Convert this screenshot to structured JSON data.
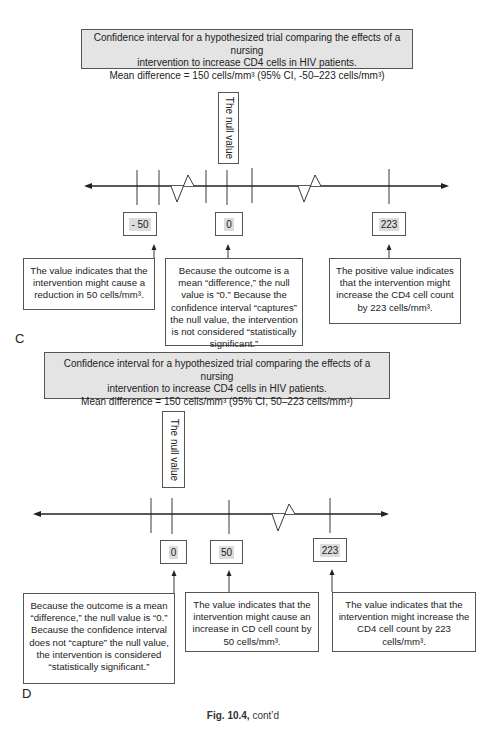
{
  "panel_c": {
    "label": "C",
    "header": {
      "line1": "Confidence interval for a hypothesized trial comparing the effects of a nursing",
      "line2": "intervention to increase CD4 cells in HIV patients.",
      "line3": "Mean difference = 150 cells/mm³ (95% CI, -50–223 cells/mm³)"
    },
    "null_label": "The null value",
    "value_boxes": [
      "- 50",
      "0",
      "223"
    ],
    "explanations": [
      "The value indicates that the intervention might cause a reduction in 50 cells/mm³.",
      "Because the outcome is a mean “difference,” the null value is “0.” Because the confidence interval “captures” the null value, the intervention is not considered “statistically significant.”",
      "The positive value indicates that the intervention might increase the CD4 cell count by 223 cells/mm³."
    ]
  },
  "panel_d": {
    "label": "D",
    "header": {
      "line1": "Confidence interval for a hypothesized trial comparing the effects of a nursing",
      "line2": "intervention to increase CD4 cells in HIV patients.",
      "line3": "Mean difference = 150 cells/mm³ (95% CI,  50–223 cells/mm³)"
    },
    "null_label": "The null value",
    "value_boxes": [
      "0",
      "50",
      "223"
    ],
    "explanations": [
      "Because the outcome is a mean “difference,” the null value is “0.” Because the confidence interval does not “capture” the null value, the intervention is considered “statistically significant.”",
      "The value indicates that the intervention might cause an increase in CD cell count by 50 cells/mm³.",
      "The value indicates that the intervention might increase the CD4 cell count by 223 cells/mm³."
    ]
  },
  "caption": {
    "bold": "Fig. 10.4,",
    "rest": " cont’d"
  },
  "colors": {
    "header_fill": "#e4e4e4",
    "value_highlight": "#dcdcdc",
    "line": "#222222"
  }
}
